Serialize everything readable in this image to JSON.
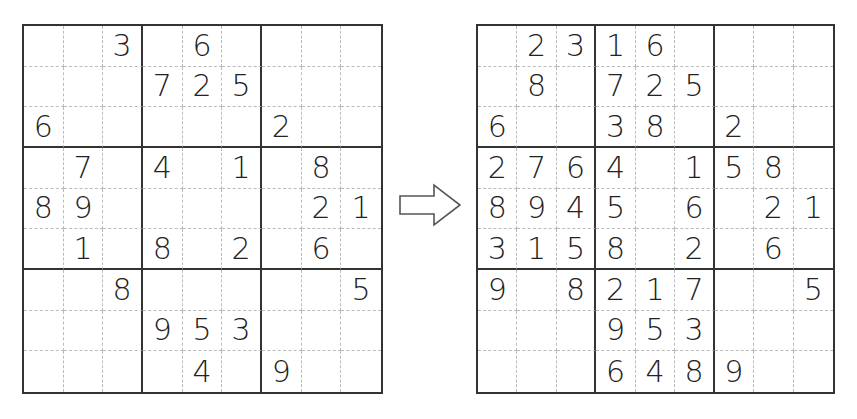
{
  "puzzle": {
    "rows": [
      [
        "",
        "",
        "3",
        "",
        "6",
        "",
        "",
        "",
        ""
      ],
      [
        "",
        "",
        "",
        "7",
        "2",
        "5",
        "",
        "",
        ""
      ],
      [
        "6",
        "",
        "",
        "",
        "",
        "",
        "2",
        "",
        ""
      ],
      [
        "",
        "7",
        "",
        "4",
        "",
        "1",
        "",
        "8",
        ""
      ],
      [
        "8",
        "9",
        "",
        "",
        "",
        "",
        "",
        "2",
        "1"
      ],
      [
        "",
        "1",
        "",
        "8",
        "",
        "2",
        "",
        "6",
        ""
      ],
      [
        "",
        "",
        "8",
        "",
        "",
        "",
        "",
        "",
        "5"
      ],
      [
        "",
        "",
        "",
        "9",
        "5",
        "3",
        "",
        "",
        ""
      ],
      [
        "",
        "",
        "",
        "",
        "4",
        "",
        "9",
        "",
        ""
      ]
    ]
  },
  "progress": {
    "rows": [
      [
        "",
        "2",
        "3",
        "1",
        "6",
        "",
        "",
        "",
        ""
      ],
      [
        "",
        "8",
        "",
        "7",
        "2",
        "5",
        "",
        "",
        ""
      ],
      [
        "6",
        "",
        "",
        "3",
        "8",
        "",
        "2",
        "",
        ""
      ],
      [
        "2",
        "7",
        "6",
        "4",
        "",
        "1",
        "5",
        "8",
        ""
      ],
      [
        "8",
        "9",
        "4",
        "5",
        "",
        "6",
        "",
        "2",
        "1"
      ],
      [
        "3",
        "1",
        "5",
        "8",
        "",
        "2",
        "",
        "6",
        ""
      ],
      [
        "9",
        "",
        "8",
        "2",
        "1",
        "7",
        "",
        "",
        "5"
      ],
      [
        "",
        "",
        "",
        "9",
        "5",
        "3",
        "",
        "",
        ""
      ],
      [
        "",
        "",
        "",
        "6",
        "4",
        "8",
        "9",
        "",
        ""
      ]
    ]
  },
  "arrow": {
    "icon": "hollow-right-arrow-icon"
  },
  "caption": {
    "text": ""
  }
}
